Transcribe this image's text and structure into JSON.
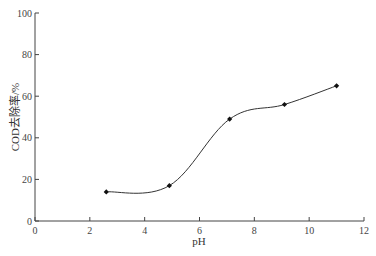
{
  "chart_data": {
    "type": "line",
    "title": "",
    "xlabel": "pH",
    "ylabel": "COD去除率/%",
    "xlim": [
      0,
      12
    ],
    "ylim": [
      0,
      100
    ],
    "xticks": [
      0,
      2,
      4,
      6,
      8,
      10,
      12
    ],
    "yticks": [
      0,
      20,
      40,
      60,
      80,
      100
    ],
    "grid": false,
    "legend": null,
    "series": [
      {
        "name": "COD去除率",
        "x": [
          2.6,
          4.9,
          7.1,
          9.1,
          11.0
        ],
        "y": [
          14,
          17,
          49,
          56,
          65
        ],
        "marker": "diamond",
        "smooth": true,
        "color": "#333333"
      }
    ]
  }
}
